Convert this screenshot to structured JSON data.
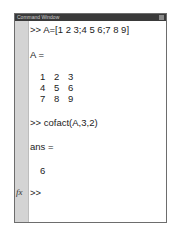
{
  "window": {
    "title": "Command Window"
  },
  "lines": {
    "cmd1": ">> A=[1 2 3;4 5 6;7 8 9]",
    "out1_label": "A =",
    "matrix": [
      [
        "1",
        "2",
        "3"
      ],
      [
        "4",
        "5",
        "6"
      ],
      [
        "7",
        "8",
        "9"
      ]
    ],
    "cmd2": ">> cofact(A,3,2)",
    "out2_label": "ans =",
    "out2_value": "6",
    "prompt": ">>"
  },
  "gutter": {
    "fx_label": "fx"
  }
}
